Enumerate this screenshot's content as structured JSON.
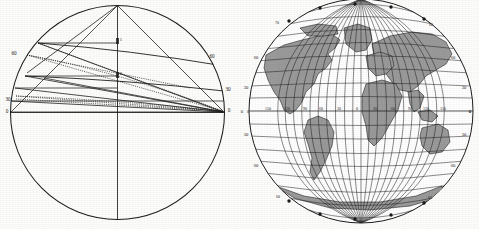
{
  "plate": {
    "title": "",
    "background_color": "#fdfdfb",
    "ink_color": "#1a1a1a",
    "land_fill_color": "#9a9a9a",
    "ocean_fill_color": "#ffffff"
  },
  "figures": [
    {
      "id": "projection-diagram",
      "name": "globular-projection-construction-diagram",
      "description": "Circle with converging chords, arcs and dotted construction lines",
      "center": {
        "x": 117.5,
        "y": 112.5
      },
      "radius": 107,
      "pole_point": {
        "x": 117.5,
        "y": 5.5
      },
      "labels_left": [
        "60",
        "30",
        "0"
      ],
      "labels_right": [
        "60",
        "30",
        "0"
      ],
      "labels_center": [
        "1",
        "2"
      ],
      "label_positions": {
        "left": [
          {
            "text": "60",
            "x": 14,
            "y": 55
          },
          {
            "text": "30",
            "x": 8,
            "y": 101
          },
          {
            "text": "0",
            "x": 7,
            "y": 113
          }
        ],
        "right": [
          {
            "text": "60",
            "x": 212,
            "y": 58
          },
          {
            "text": "30",
            "x": 228,
            "y": 91
          },
          {
            "text": "0",
            "x": 229,
            "y": 112
          }
        ],
        "center": [
          {
            "text": "1",
            "x": 120,
            "y": 41
          },
          {
            "text": "2",
            "x": 120,
            "y": 75
          }
        ]
      }
    },
    {
      "id": "orthographic-globe",
      "name": "world-globe-graticule-map",
      "description": "Orthographic world map with 10-degree graticule and shaded continents",
      "center": {
        "x": 121,
        "y": 111
      },
      "radius": 112,
      "graticule_step_degrees": 10,
      "equator_labels": [
        "0",
        "150",
        "120",
        "90",
        "60",
        "30",
        "0",
        "30",
        "60",
        "90",
        "120",
        "150",
        "0"
      ],
      "left_meridian_labels": [
        "60",
        "30",
        "0",
        "30",
        "60"
      ],
      "right_meridian_labels": [
        "60",
        "30",
        "0",
        "30",
        "60"
      ],
      "upper_rim_labels": [
        "70",
        "60"
      ],
      "lower_rim_labels": [
        "60",
        "60"
      ],
      "equator_label_positions": [
        {
          "text": "0",
          "x": 8,
          "y": 113
        },
        {
          "text": "150",
          "x": 28,
          "y": 111
        },
        {
          "text": "120",
          "x": 47,
          "y": 111
        },
        {
          "text": "90",
          "x": 65,
          "y": 111
        },
        {
          "text": "60",
          "x": 81,
          "y": 111
        },
        {
          "text": "30",
          "x": 99,
          "y": 111
        },
        {
          "text": "0",
          "x": 117,
          "y": 111
        },
        {
          "text": "30",
          "x": 135,
          "y": 111
        },
        {
          "text": "60",
          "x": 153,
          "y": 111
        },
        {
          "text": "90",
          "x": 170,
          "y": 111
        },
        {
          "text": "120",
          "x": 186,
          "y": 111
        },
        {
          "text": "150",
          "x": 203,
          "y": 111
        },
        {
          "text": "0",
          "x": 228,
          "y": 113
        }
      ],
      "left_rim_label_positions": [
        {
          "text": "60",
          "x": 16,
          "y": 59
        },
        {
          "text": "30",
          "x": 6,
          "y": 89
        },
        {
          "text": "0",
          "x": 2,
          "y": 113
        },
        {
          "text": "30",
          "x": 6,
          "y": 136
        },
        {
          "text": "60",
          "x": 16,
          "y": 167
        }
      ],
      "right_rim_label_positions": [
        {
          "text": "60",
          "x": 213,
          "y": 59
        },
        {
          "text": "30",
          "x": 224,
          "y": 89
        },
        {
          "text": "0",
          "x": 230,
          "y": 113
        },
        {
          "text": "30",
          "x": 224,
          "y": 136
        },
        {
          "text": "60",
          "x": 213,
          "y": 167
        }
      ],
      "top_rim_label_positions": [
        {
          "text": "70",
          "x": 37,
          "y": 24
        },
        {
          "text": "60",
          "x": 191,
          "y": 26
        }
      ],
      "bottom_rim_label_positions": [
        {
          "text": "60",
          "x": 38,
          "y": 198
        },
        {
          "text": "60",
          "x": 190,
          "y": 199
        }
      ]
    }
  ]
}
